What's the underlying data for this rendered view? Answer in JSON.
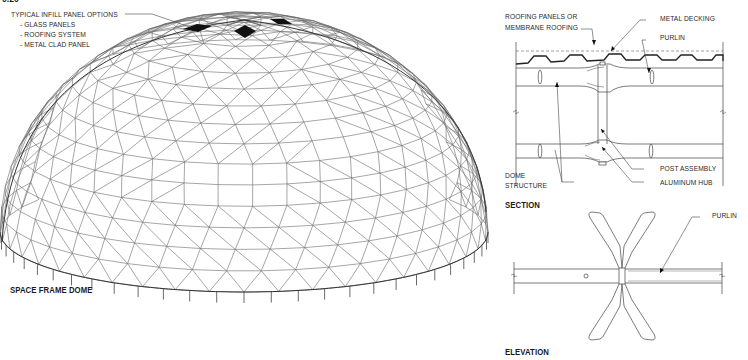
{
  "figure_ref_clipped": "0.20",
  "dome": {
    "title": "SPACE FRAME DOME",
    "callout": {
      "heading": "TYPICAL INFILL PANEL OPTIONS",
      "options": [
        "- GLASS PANELS",
        "- ROOFING SYSTEM",
        "- METAL CLAD PANEL"
      ]
    },
    "filled_panels": 3
  },
  "section": {
    "title": "SECTION",
    "labels": {
      "roofing": [
        "ROOFING PANELS OR",
        "MEMBRANE ROOFING"
      ],
      "decking": "METAL DECKING",
      "purlin": "PURLIN",
      "post": "POST ASSEMBLY",
      "hub": "ALUMINUM HUB",
      "dome_structure": [
        "DOME",
        "STRUCTURE"
      ]
    }
  },
  "elevation": {
    "title": "ELEVATION",
    "labels": {
      "purlin": "PURLIN"
    }
  },
  "colors": {
    "line": "#555555",
    "ink": "#1a1a1a",
    "fill": "#111111"
  }
}
